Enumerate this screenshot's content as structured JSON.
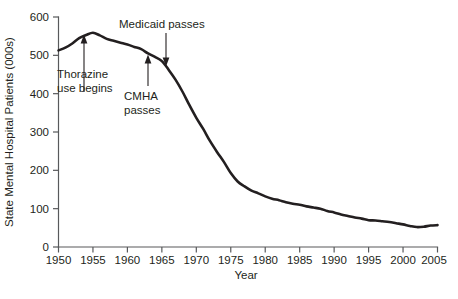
{
  "chart_data": {
    "type": "line",
    "title": "",
    "xlabel": "Year",
    "ylabel": "State Mental Hospital Patients (000s)",
    "xlim": [
      1950,
      2005
    ],
    "ylim": [
      0,
      600
    ],
    "grid": false,
    "legend_position": "none",
    "xticks": [
      "1950",
      "1955",
      "1960",
      "1965",
      "1970",
      "1975",
      "1980",
      "1985",
      "1990",
      "1995",
      "2000",
      "2005"
    ],
    "ytick_values": [
      0,
      100,
      200,
      300,
      400,
      500,
      600
    ],
    "yticks": [
      "0",
      "100",
      "200",
      "300",
      "400",
      "500",
      "600"
    ],
    "line_color": "#231f20",
    "x": [
      1950,
      1951,
      1952,
      1953,
      1954,
      1955,
      1956,
      1957,
      1958,
      1959,
      1960,
      1961,
      1962,
      1963,
      1964,
      1965,
      1966,
      1967,
      1968,
      1969,
      1970,
      1971,
      1972,
      1973,
      1974,
      1975,
      1976,
      1977,
      1978,
      1979,
      1980,
      1981,
      1982,
      1983,
      1984,
      1985,
      1986,
      1987,
      1988,
      1989,
      1990,
      1991,
      1992,
      1993,
      1994,
      1995,
      1996,
      1997,
      1998,
      1999,
      2000,
      2001,
      2002,
      2003,
      2004,
      2005
    ],
    "values": [
      513,
      520,
      531,
      545,
      553,
      559,
      552,
      543,
      538,
      533,
      528,
      522,
      516,
      505,
      496,
      485,
      462,
      436,
      405,
      370,
      337,
      308,
      276,
      248,
      222,
      193,
      171,
      158,
      147,
      140,
      132,
      126,
      122,
      117,
      113,
      110,
      106,
      103,
      100,
      94,
      90,
      85,
      81,
      77,
      74,
      70,
      69,
      67,
      65,
      62,
      59,
      55,
      52,
      53,
      56,
      57
    ],
    "annotations": [
      {
        "label": "Thorazine\nuse begins",
        "label_line_1": "Thorazine",
        "label_line_2": "use begins",
        "arrow_direction": "up",
        "point_year": 1954,
        "point_value": 550
      },
      {
        "label": "CMHA\npasses",
        "label_line_1": "CMHA",
        "label_line_2": "passes",
        "arrow_direction": "up",
        "point_year": 1963,
        "point_value": 505
      },
      {
        "label": "Medicaid passes",
        "label_line_1": "Medicaid passes",
        "arrow_direction": "down",
        "point_year": 1965,
        "point_value": 485
      }
    ]
  }
}
